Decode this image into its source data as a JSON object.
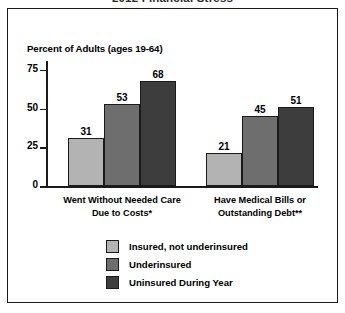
{
  "title_fragment": "2012 Financial Stress",
  "axis_caption": "Percent of Adults (ages 19-64)",
  "colors": {
    "series1": "#b3b3b3",
    "series2": "#6e6e6e",
    "series3": "#3d3d3d",
    "outline": "#1a1a1a",
    "background": "#ffffff"
  },
  "chart_data": {
    "type": "bar",
    "title": "2012 Financial Stress",
    "xlabel": "",
    "ylabel": "Percent of Adults (ages 19-64)",
    "ylim": [
      0,
      80
    ],
    "yticks": [
      0,
      25,
      50,
      75
    ],
    "grid": false,
    "legend_position": "bottom",
    "categories": [
      "Went Without Needed Care Due to Costs*",
      "Have Medical Bills or Outstanding Debt**"
    ],
    "category_lines": [
      [
        "Went Without Needed Care",
        "Due to Costs*"
      ],
      [
        "Have Medical Bills or",
        "Outstanding Debt**"
      ]
    ],
    "series": [
      {
        "name": "Insured, not underinsured",
        "values": [
          31,
          21
        ],
        "color": "#b3b3b3"
      },
      {
        "name": "Underinsured",
        "values": [
          53,
          45
        ],
        "color": "#6e6e6e"
      },
      {
        "name": "Uninsured During Year",
        "values": [
          68,
          51
        ],
        "color": "#3d3d3d"
      }
    ]
  },
  "y_ticks": [
    {
      "label": "75",
      "value": 75
    },
    {
      "label": "50",
      "value": 50
    },
    {
      "label": "25",
      "value": 25
    },
    {
      "label": "0",
      "value": 0
    }
  ],
  "legend": [
    {
      "label": "Insured, not underinsured",
      "color": "#b3b3b3"
    },
    {
      "label": "Underinsured",
      "color": "#6e6e6e"
    },
    {
      "label": "Uninsured During Year",
      "color": "#3d3d3d"
    }
  ]
}
